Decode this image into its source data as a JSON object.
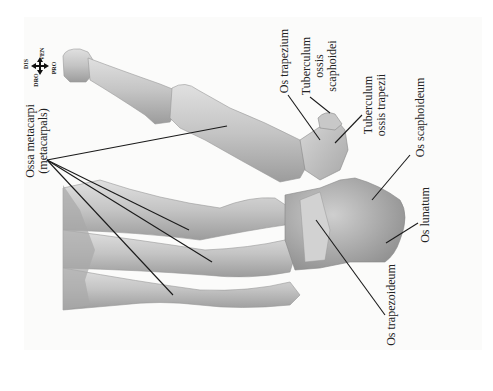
{
  "figure": {
    "type": "anatomical illustration",
    "colors": {
      "background": "#ffffff",
      "panel": "#fbfbfa",
      "bone_light": "#d9d9d9",
      "bone_mid": "#b5b5b5",
      "bone_dark": "#8a8a8a",
      "leader_line": "#1a1a1a",
      "text": "#222222"
    }
  },
  "compass": {
    "top": "DIS",
    "left": "DRO",
    "right": "VEN",
    "bottom": "PRO"
  },
  "labels": {
    "ossa_metacarpi": {
      "line1": "Ossa metacarpi",
      "line2": "(metacarpals)"
    },
    "os_trapezium": "Os trapezium",
    "tuberculum_ossis_scaphoidei": {
      "line1": "Tuberculum",
      "line2": "ossis",
      "line3": "scaphoidei"
    },
    "tuberculum_ossis_trapezii": {
      "line1": "Tuberculum",
      "line2": "ossis trapezii"
    },
    "os_scaphoideum": "Os scaphoideum",
    "os_lunatum": "Os lunatum",
    "os_trapezoideum": "Os trapezoideum"
  }
}
